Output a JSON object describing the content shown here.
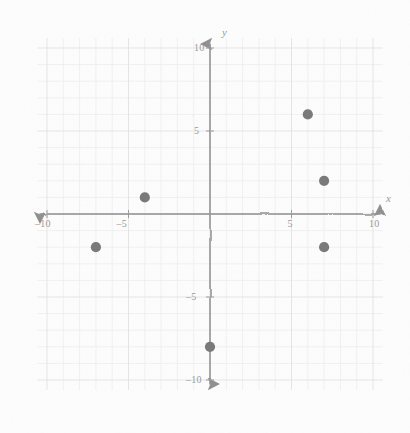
{
  "figure": {
    "background_color": "#fdfdfd",
    "axis_color": "#8f8f8f",
    "grid_color": "#ececec",
    "point_color": "#787878",
    "label_color": "#9a9a9a"
  },
  "axes": {
    "x_label": "x",
    "y_label": "y",
    "x_ticks": [
      {
        "value": -10,
        "label": "–10"
      },
      {
        "value": -5,
        "label": "–5"
      },
      {
        "value": 5,
        "label": "5"
      },
      {
        "value": 10,
        "label": "10"
      }
    ],
    "y_ticks": [
      {
        "value": 10,
        "label": "10"
      },
      {
        "value": 5,
        "label": "5"
      },
      {
        "value": -5,
        "label": "–5"
      },
      {
        "value": -10,
        "label": "–10"
      }
    ]
  },
  "chart_data": {
    "type": "scatter",
    "title": "",
    "xlabel": "x",
    "ylabel": "y",
    "xlim": [
      -11,
      11
    ],
    "ylim": [
      -11,
      11
    ],
    "xticks": [
      -10,
      -5,
      5,
      10
    ],
    "yticks": [
      -10,
      -5,
      5,
      10
    ],
    "grid": true,
    "grid_step": 1,
    "legend": "none",
    "series": [
      {
        "name": "points",
        "marker": "filled-circle",
        "color": "#787878",
        "points": [
          {
            "x": -7,
            "y": -2
          },
          {
            "x": -4,
            "y": 1
          },
          {
            "x": 0,
            "y": -8
          },
          {
            "x": 6,
            "y": 6
          },
          {
            "x": 7,
            "y": 2
          },
          {
            "x": 7,
            "y": -2
          }
        ]
      }
    ]
  }
}
